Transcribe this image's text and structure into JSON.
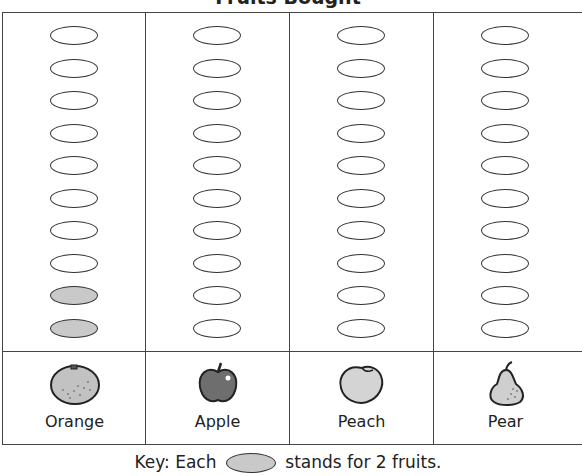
{
  "title": "Fruits Bought",
  "key": {
    "prefix": "Key: Each",
    "suffix": "stands for 2 fruits.",
    "symbol_fill": "#c9c9c9"
  },
  "columns": [
    {
      "label": "Orange",
      "icon": "orange-icon",
      "total_ovals": 10,
      "filled_ovals": 2
    },
    {
      "label": "Apple",
      "icon": "apple-icon",
      "total_ovals": 10,
      "filled_ovals": 0
    },
    {
      "label": "Peach",
      "icon": "peach-icon",
      "total_ovals": 10,
      "filled_ovals": 0
    },
    {
      "label": "Pear",
      "icon": "pear-icon",
      "total_ovals": 10,
      "filled_ovals": 0
    }
  ],
  "chart_data": {
    "type": "bar",
    "title": "Fruits Bought",
    "categories": [
      "Orange",
      "Apple",
      "Peach",
      "Pear"
    ],
    "values": [
      4,
      0,
      0,
      0
    ],
    "symbols_shaded": [
      2,
      0,
      0,
      0
    ],
    "symbols_per_column": 10,
    "symbol_value": 2,
    "legend": "Key: Each oval stands for 2 fruits.",
    "xlabel": "",
    "ylabel": "",
    "ylim": [
      0,
      20
    ],
    "grid": true
  }
}
